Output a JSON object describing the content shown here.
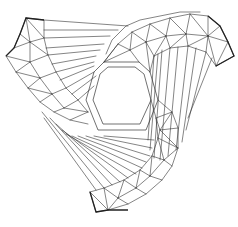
{
  "figure": {
    "title": "",
    "description": "Triangulated mesh of a three-armed swirl around a central hexagonal hole",
    "background": "#ffffff",
    "stroke_color": "#333333",
    "outline_color": "#222222",
    "arms": 3,
    "center_shape": "hexagon"
  }
}
